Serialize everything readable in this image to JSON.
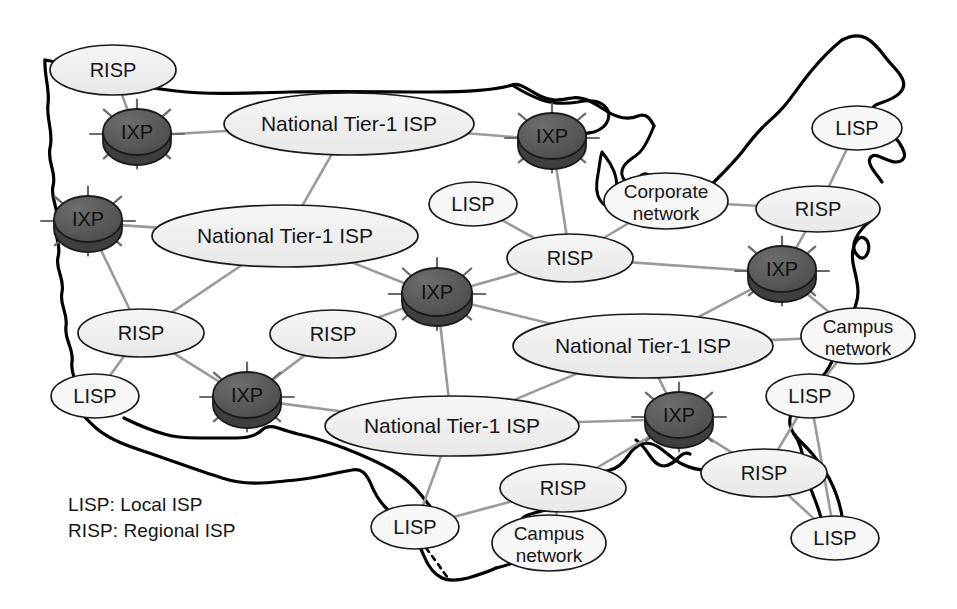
{
  "diagram": {
    "colors": {
      "ellipse_fill": "#eeeeee",
      "ellipse_fill_light": "#f7f7f7",
      "ellipse_stroke": "#1a1a1a",
      "ixp_fill": "#555555",
      "ixp_fill_dark": "#3f3f3f",
      "ixp_stroke": "#1a1a1a",
      "link": "#9a9a9a",
      "map_outline": "#000000",
      "text": "#151515"
    },
    "legend": [
      "LISP: Local ISP",
      "RISP: Regional ISP"
    ],
    "nodes": [
      {
        "id": "risp-nw",
        "label": "RISP",
        "type": "risp",
        "x": 113,
        "y": 70,
        "rx": 63,
        "ry": 25
      },
      {
        "id": "ixp-nw",
        "label": "IXP",
        "type": "ixp",
        "x": 137,
        "y": 136,
        "rx": 34,
        "ry": 23
      },
      {
        "id": "nt1-north",
        "label": "National Tier-1 ISP",
        "type": "tier1",
        "x": 349,
        "y": 124,
        "rx": 125,
        "ry": 31
      },
      {
        "id": "ixp-north",
        "label": "IXP",
        "type": "ixp",
        "x": 552,
        "y": 140,
        "rx": 34,
        "ry": 23
      },
      {
        "id": "lisp-ne",
        "label": "LISP",
        "type": "lisp",
        "x": 857,
        "y": 128,
        "rx": 45,
        "ry": 22
      },
      {
        "id": "corporate",
        "label": "Corporate\nnetwork",
        "type": "campus",
        "x": 666,
        "y": 201,
        "rx": 62,
        "ry": 28
      },
      {
        "id": "risp-ne",
        "label": "RISP",
        "type": "risp",
        "x": 818,
        "y": 209,
        "rx": 62,
        "ry": 23
      },
      {
        "id": "ixp-west",
        "label": "IXP",
        "type": "ixp",
        "x": 88,
        "y": 223,
        "rx": 34,
        "ry": 23
      },
      {
        "id": "nt1-west",
        "label": "National Tier-1 ISP",
        "type": "tier1",
        "x": 285,
        "y": 236,
        "rx": 133,
        "ry": 31
      },
      {
        "id": "lisp-center",
        "label": "LISP",
        "type": "lisp",
        "x": 473,
        "y": 204,
        "rx": 44,
        "ry": 22
      },
      {
        "id": "risp-center",
        "label": "RISP",
        "type": "risp",
        "x": 570,
        "y": 258,
        "rx": 63,
        "ry": 24
      },
      {
        "id": "ixp-east",
        "label": "IXP",
        "type": "ixp",
        "x": 782,
        "y": 273,
        "rx": 34,
        "ry": 23
      },
      {
        "id": "ixp-central",
        "label": "IXP",
        "type": "ixp",
        "x": 437,
        "y": 296,
        "rx": 35,
        "ry": 24
      },
      {
        "id": "risp-w",
        "label": "RISP",
        "type": "risp",
        "x": 141,
        "y": 333,
        "rx": 63,
        "ry": 24
      },
      {
        "id": "risp-sw",
        "label": "RISP",
        "type": "risp",
        "x": 333,
        "y": 334,
        "rx": 63,
        "ry": 24
      },
      {
        "id": "nt1-east",
        "label": "National Tier-1 ISP",
        "type": "tier1",
        "x": 643,
        "y": 346,
        "rx": 130,
        "ry": 32
      },
      {
        "id": "campus-east",
        "label": "Campus\nnetwork",
        "type": "campus",
        "x": 858,
        "y": 336,
        "rx": 57,
        "ry": 28
      },
      {
        "id": "lisp-w",
        "label": "LISP",
        "type": "lisp",
        "x": 95,
        "y": 396,
        "rx": 44,
        "ry": 22
      },
      {
        "id": "ixp-sw",
        "label": "IXP",
        "type": "ixp",
        "x": 247,
        "y": 399,
        "rx": 34,
        "ry": 23
      },
      {
        "id": "lisp-se",
        "label": "LISP",
        "type": "lisp",
        "x": 810,
        "y": 396,
        "rx": 44,
        "ry": 22
      },
      {
        "id": "nt1-south",
        "label": "National Tier-1 ISP",
        "type": "tier1",
        "x": 452,
        "y": 426,
        "rx": 127,
        "ry": 30
      },
      {
        "id": "ixp-south",
        "label": "IXP",
        "type": "ixp",
        "x": 679,
        "y": 419,
        "rx": 34,
        "ry": 23
      },
      {
        "id": "risp-south",
        "label": "RISP",
        "type": "risp",
        "x": 563,
        "y": 488,
        "rx": 63,
        "ry": 24
      },
      {
        "id": "risp-se",
        "label": "RISP",
        "type": "risp",
        "x": 764,
        "y": 473,
        "rx": 63,
        "ry": 24
      },
      {
        "id": "lisp-south",
        "label": "LISP",
        "type": "lisp",
        "x": 415,
        "y": 527,
        "rx": 44,
        "ry": 22
      },
      {
        "id": "campus-south",
        "label": "Campus\nnetwork",
        "type": "campus",
        "x": 549,
        "y": 543,
        "rx": 57,
        "ry": 28
      },
      {
        "id": "lisp-far-se",
        "label": "LISP",
        "type": "lisp",
        "x": 835,
        "y": 538,
        "rx": 44,
        "ry": 22
      }
    ],
    "links": [
      [
        "risp-nw",
        "ixp-nw"
      ],
      [
        "ixp-nw",
        "nt1-north"
      ],
      [
        "nt1-north",
        "ixp-north"
      ],
      [
        "nt1-north",
        "nt1-west"
      ],
      [
        "ixp-north",
        "risp-center"
      ],
      [
        "lisp-ne",
        "risp-ne"
      ],
      [
        "corporate",
        "risp-center"
      ],
      [
        "risp-ne",
        "corporate"
      ],
      [
        "risp-ne",
        "ixp-east"
      ],
      [
        "ixp-west",
        "nt1-west"
      ],
      [
        "ixp-west",
        "risp-w"
      ],
      [
        "lisp-center",
        "risp-center"
      ],
      [
        "risp-center",
        "ixp-central"
      ],
      [
        "risp-center",
        "ixp-east"
      ],
      [
        "nt1-west",
        "ixp-central"
      ],
      [
        "ixp-east",
        "nt1-east"
      ],
      [
        "ixp-east",
        "campus-east"
      ],
      [
        "risp-w",
        "nt1-west"
      ],
      [
        "risp-w",
        "lisp-w"
      ],
      [
        "risp-w",
        "ixp-sw"
      ],
      [
        "risp-sw",
        "ixp-sw"
      ],
      [
        "risp-sw",
        "ixp-central"
      ],
      [
        "ixp-central",
        "nt1-east"
      ],
      [
        "ixp-central",
        "nt1-south"
      ],
      [
        "nt1-east",
        "campus-east"
      ],
      [
        "nt1-east",
        "ixp-south"
      ],
      [
        "nt1-east",
        "nt1-south"
      ],
      [
        "campus-east",
        "lisp-se"
      ],
      [
        "ixp-sw",
        "nt1-south"
      ],
      [
        "lisp-se",
        "risp-se"
      ],
      [
        "nt1-south",
        "ixp-south"
      ],
      [
        "nt1-south",
        "lisp-south"
      ],
      [
        "ixp-south",
        "risp-south"
      ],
      [
        "ixp-south",
        "risp-se"
      ],
      [
        "risp-south",
        "lisp-south"
      ],
      [
        "risp-south",
        "campus-south"
      ],
      [
        "risp-se",
        "lisp-far-se"
      ],
      [
        "lisp-se",
        "lisp-far-se"
      ]
    ]
  }
}
